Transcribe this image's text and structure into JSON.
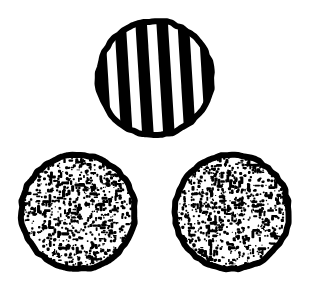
{
  "figure": {
    "description": "Black-and-white figure: one circle filled with vertical stripes above two circles filled with random dot stipple.",
    "background_color": "#ffffff",
    "ink_color": "#000000",
    "canvas": {
      "width": 313,
      "height": 297
    }
  },
  "shapes": [
    {
      "id": "striped-circle",
      "name": "striped-circle",
      "label": "Striped circle",
      "texture": "vertical-stripes",
      "center_x": 155,
      "center_y": 78,
      "radius": 60,
      "outline_width": 6,
      "outline_color": "#000000",
      "fill_color": "#ffffff",
      "stripe_color": "#000000",
      "stripe_count": 5,
      "stripe_period": 21,
      "stripe_white_width": 9.5,
      "stripe_black_width": 11.5,
      "stripe_tilt_deg": -3.5
    },
    {
      "id": "stippled-circle-left",
      "name": "stippled-circle-left",
      "label": "Stippled circle (left)",
      "texture": "random-dots",
      "center_x": 78,
      "center_y": 212,
      "radius": 60,
      "outline_width": 6,
      "outline_color": "#000000",
      "fill_color": "#ffffff",
      "dot_color": "#000000",
      "dot_count": 760,
      "dot_min_size": 1.1,
      "dot_max_size": 3.2,
      "seed": 1337
    },
    {
      "id": "stippled-circle-right",
      "name": "stippled-circle-right",
      "label": "Stippled circle (right)",
      "texture": "random-dots",
      "center_x": 232,
      "center_y": 212,
      "radius": 60,
      "outline_width": 6,
      "outline_color": "#000000",
      "fill_color": "#ffffff",
      "dot_color": "#000000",
      "dot_count": 760,
      "dot_min_size": 1.1,
      "dot_max_size": 3.2,
      "seed": 98765
    }
  ]
}
